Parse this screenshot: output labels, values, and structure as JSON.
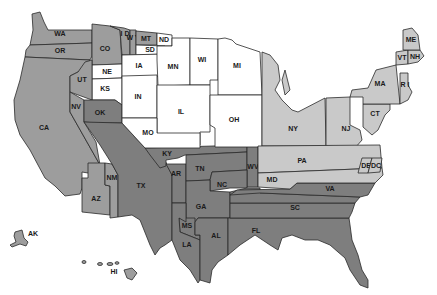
{
  "map": {
    "type": "choropleth",
    "region": "United States",
    "shade_levels": {
      "white": "#ffffff",
      "light": "#c9c9c9",
      "mid": "#9d9d9d",
      "dark": "#7e7e7e"
    },
    "states": {
      "WA": {
        "label": "WA",
        "shade": "mid"
      },
      "OR": {
        "label": "OR",
        "shade": "mid"
      },
      "CA": {
        "label": "CA",
        "shade": "mid"
      },
      "CO": {
        "label": "CO",
        "shade": "mid"
      },
      "ID": {
        "label": "I D",
        "shade": "mid"
      },
      "WY": {
        "label": "W Y",
        "shade": "mid"
      },
      "MT": {
        "label": "MT",
        "shade": "mid"
      },
      "ND": {
        "label": "ND",
        "shade": "white"
      },
      "SD": {
        "label": "SD",
        "shade": "white"
      },
      "NE": {
        "label": "NE",
        "shade": "white"
      },
      "KS": {
        "label": "KS",
        "shade": "white"
      },
      "UT": {
        "label": "UT",
        "shade": "mid"
      },
      "NV": {
        "label": "NV",
        "shade": "mid"
      },
      "AZ": {
        "label": "AZ",
        "shade": "mid"
      },
      "NM": {
        "label": "NM",
        "shade": "mid"
      },
      "OK": {
        "label": "OK",
        "shade": "dark"
      },
      "TX": {
        "label": "TX",
        "shade": "dark"
      },
      "IA": {
        "label": "IA",
        "shade": "white"
      },
      "MN": {
        "label": "MN",
        "shade": "white"
      },
      "WI": {
        "label": "WI",
        "shade": "white"
      },
      "MI": {
        "label": "MI",
        "shade": "white"
      },
      "IN": {
        "label": "IN",
        "shade": "white"
      },
      "IL": {
        "label": "IL",
        "shade": "white"
      },
      "OH": {
        "label": "OH",
        "shade": "white"
      },
      "MO": {
        "label": "MO",
        "shade": "white"
      },
      "KY": {
        "label": "KY",
        "shade": "dark"
      },
      "AR": {
        "label": "AR",
        "shade": "dark"
      },
      "TN": {
        "label": "TN",
        "shade": "dark"
      },
      "WV": {
        "label": "WV",
        "shade": "dark"
      },
      "NC": {
        "label": "NC",
        "shade": "dark"
      },
      "GA": {
        "label": "GA",
        "shade": "dark"
      },
      "MS": {
        "label": "MS",
        "shade": "dark"
      },
      "LA": {
        "label": "LA",
        "shade": "dark"
      },
      "AL": {
        "label": "AL",
        "shade": "dark"
      },
      "FL": {
        "label": "FL",
        "shade": "dark"
      },
      "SC": {
        "label": "SC",
        "shade": "dark"
      },
      "VA": {
        "label": "VA",
        "shade": "dark"
      },
      "NY": {
        "label": "NY",
        "shade": "light"
      },
      "NJ": {
        "label": "NJ",
        "shade": "light"
      },
      "PA": {
        "label": "PA",
        "shade": "light"
      },
      "MD": {
        "label": "MD",
        "shade": "light"
      },
      "DE": {
        "label": "DE",
        "shade": "light"
      },
      "DC": {
        "label": "DC",
        "shade": "light"
      },
      "CT": {
        "label": "CT",
        "shade": "light"
      },
      "MA": {
        "label": "MA",
        "shade": "light"
      },
      "RI": {
        "label": "R I",
        "shade": "light"
      },
      "VT": {
        "label": "VT",
        "shade": "light"
      },
      "NH": {
        "label": "NH",
        "shade": "light"
      },
      "ME": {
        "label": "ME",
        "shade": "light"
      },
      "AK": {
        "label": "AK",
        "shade": "mid"
      },
      "HI": {
        "label": "HI",
        "shade": "mid"
      }
    }
  }
}
